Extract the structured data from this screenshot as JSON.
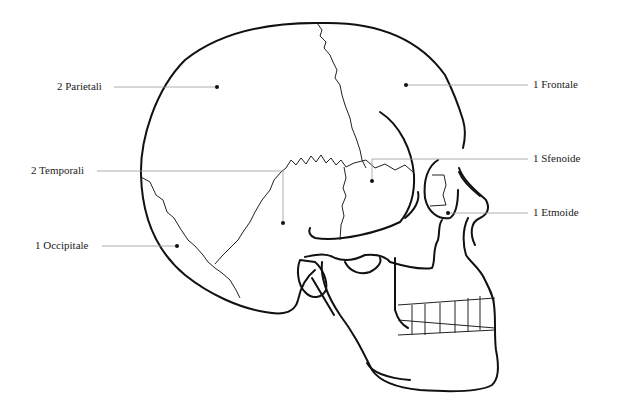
{
  "diagram": {
    "labels": [
      {
        "id": "parietali",
        "text": "2 Parietali",
        "side": "left"
      },
      {
        "id": "temporali",
        "text": "2 Temporali",
        "side": "left"
      },
      {
        "id": "occipitale",
        "text": "1 Occipitale",
        "side": "left"
      },
      {
        "id": "frontale",
        "text": "1 Frontale",
        "side": "right"
      },
      {
        "id": "sfenoide",
        "text": "1 Sfenoide",
        "side": "right"
      },
      {
        "id": "etmoide",
        "text": "1 Etmoide",
        "side": "right"
      }
    ],
    "colors": {
      "outline": "#111111",
      "leader": "#999999",
      "text": "#222222",
      "background": "#ffffff"
    }
  }
}
